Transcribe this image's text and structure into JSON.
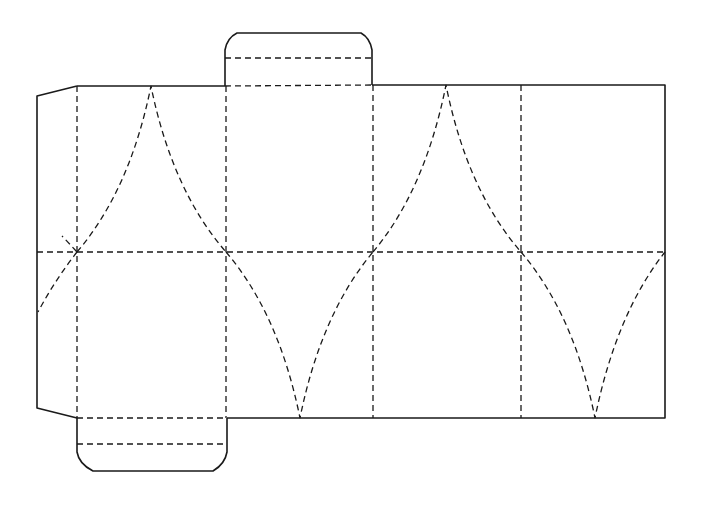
{
  "diagram": {
    "type": "die-cut packaging net",
    "colors": {
      "background": "#ffffff",
      "line": "#1a1a1a"
    },
    "legend": {
      "solid": "cut line",
      "dashed": "fold line"
    },
    "panels": [
      {
        "name": "panel-1",
        "x": [
          77,
          226
        ]
      },
      {
        "name": "panel-2",
        "x": [
          226,
          373
        ]
      },
      {
        "name": "panel-3",
        "x": [
          373,
          521
        ]
      },
      {
        "name": "panel-4",
        "x": [
          521,
          665
        ]
      }
    ],
    "main_body": {
      "x": 77,
      "y": 85,
      "width": 588,
      "height": 333,
      "middle_fold_y": 252
    },
    "glue_flap": {
      "side": "left",
      "x": 37
    },
    "top_tab": {
      "x": [
        225,
        372
      ],
      "y_top": 33,
      "fold_y": 58
    },
    "bottom_tab": {
      "x": [
        77,
        227
      ],
      "y_bottom": 471,
      "fold_y": 444
    }
  }
}
